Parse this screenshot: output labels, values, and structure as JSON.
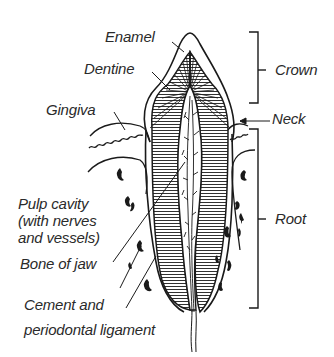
{
  "diagram": {
    "labels": {
      "enamel": "Enamel",
      "dentine": "Dentine",
      "gingiva": "Gingiva",
      "pulp_cavity_line1": "Pulp cavity",
      "pulp_cavity_line2": "(with nerves",
      "pulp_cavity_line3": "and vessels)",
      "bone_of_jaw": "Bone of jaw",
      "cement_line1": "Cement and",
      "cement_line2": "periodontal ligament",
      "crown": "Crown",
      "neck": "Neck",
      "root": "Root"
    },
    "regions": [
      "Crown",
      "Neck",
      "Root"
    ],
    "colors": {
      "ink": "#1a1a1a",
      "background": "#ffffff",
      "text": "#2a2a2a"
    }
  }
}
